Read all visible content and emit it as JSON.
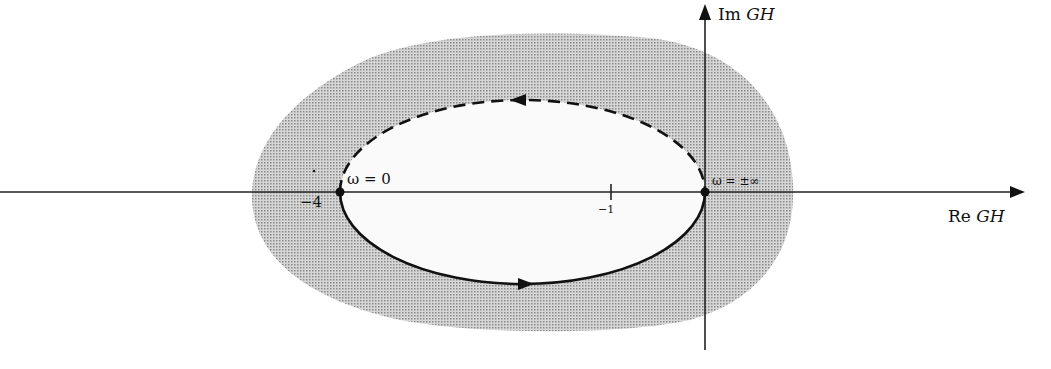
{
  "diagram": {
    "type": "nyquist-plot",
    "axes": {
      "x_label_prefix": "Re",
      "x_label_var": "GH",
      "y_label_prefix": "Im",
      "y_label_var": "GH"
    },
    "ticks": [
      {
        "label": "−4",
        "value": -4
      },
      {
        "label": "−1",
        "value": -1
      }
    ],
    "points": [
      {
        "label": "ω = 0",
        "re": -4,
        "im": 0
      },
      {
        "label": "ω = ±∞",
        "re": 0,
        "im": 0
      }
    ],
    "curves": [
      {
        "name": "positive-frequency",
        "style": "solid",
        "direction": "left-to-right (lower half)"
      },
      {
        "name": "negative-frequency",
        "style": "dashed",
        "direction": "right-to-left (upper half)"
      }
    ],
    "shaded_region": "stippled gray region surrounding the contour",
    "colors": {
      "ink": "#111111",
      "shade": "#bdbdbd"
    }
  }
}
